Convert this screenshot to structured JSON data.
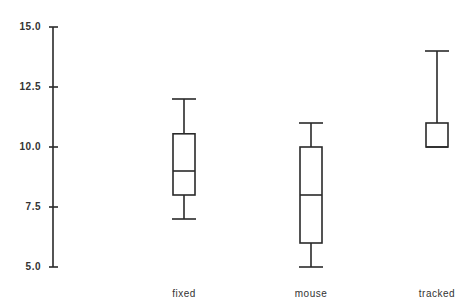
{
  "chart_data": {
    "type": "box",
    "title": "",
    "xlabel": "",
    "ylabel": "",
    "ylim": [
      5.0,
      15.0
    ],
    "yticks": [
      15.0,
      12.5,
      10.0,
      7.5,
      5.0
    ],
    "ytick_labels": [
      "15.0",
      "12.5",
      "10.0",
      "7.5",
      "5.0"
    ],
    "grid": false,
    "legend": null,
    "categories": [
      "fixed",
      "mouse",
      "tracked"
    ],
    "series": [
      {
        "name": "fixed",
        "whisker_low": 7.0,
        "q1": 8.0,
        "median": 9.0,
        "q3": 10.55,
        "whisker_high": 12.0
      },
      {
        "name": "mouse",
        "whisker_low": 5.0,
        "q1": 6.0,
        "median": 8.0,
        "q3": 10.0,
        "whisker_high": 11.0
      },
      {
        "name": "tracked",
        "whisker_low": 10.0,
        "q1": 10.0,
        "median": 10.0,
        "q3": 11.0,
        "whisker_high": 14.0
      }
    ]
  },
  "colors": {
    "stroke": "#2a2a2a",
    "background": "#ffffff"
  }
}
